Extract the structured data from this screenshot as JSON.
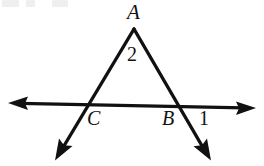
{
  "figure": {
    "type": "geometry-diagram",
    "background_color": "#ffffff",
    "stroke_color": "#111111",
    "labels": {
      "apex": "A",
      "interior_angle": "2",
      "left_base_vertex": "C",
      "right_base_vertex": "B",
      "exterior_angle": "1"
    },
    "points": {
      "A": {
        "x": 134,
        "y": 29
      },
      "C": {
        "x": 84,
        "y": 105
      },
      "B": {
        "x": 180,
        "y": 107
      },
      "left_ray_end": {
        "x": 55,
        "y": 160
      },
      "right_ray_end": {
        "x": 211,
        "y": 160
      },
      "line_left_end": {
        "x": 8,
        "y": 103
      },
      "line_right_end": {
        "x": 256,
        "y": 108
      }
    },
    "arrowheads": [
      {
        "name": "horizontal-line-left-arrowhead",
        "direction": "left"
      },
      {
        "name": "horizontal-line-right-arrowhead",
        "direction": "right"
      },
      {
        "name": "left-ray-arrowhead",
        "direction": "down-left"
      },
      {
        "name": "right-ray-arrowhead",
        "direction": "down-right"
      }
    ],
    "top_crop_artifacts": [
      "",
      "",
      ""
    ]
  }
}
